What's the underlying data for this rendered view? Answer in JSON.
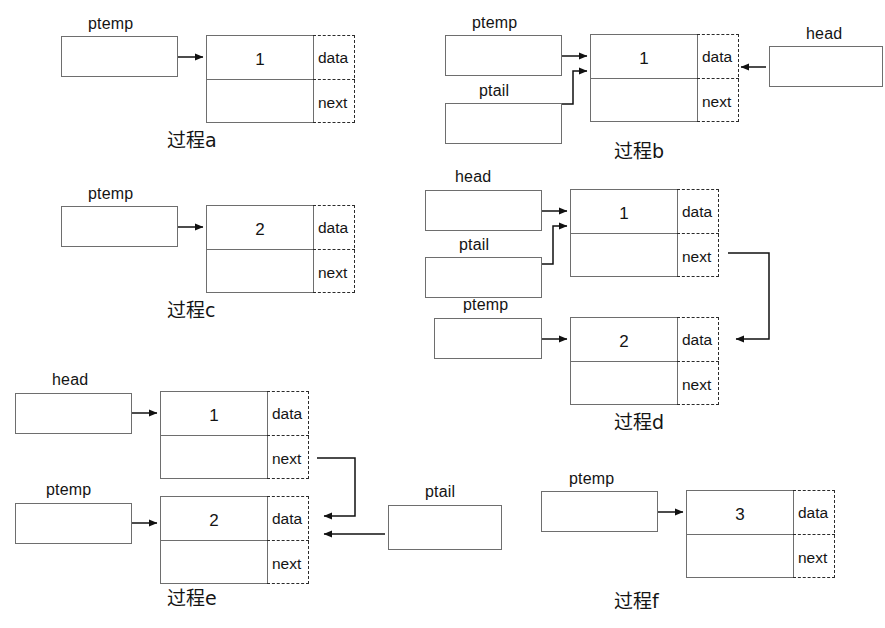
{
  "diagram": {
    "stroke_color": "#6e6e6e",
    "dash_color": "#2b2b2b",
    "background": "#ffffff",
    "field_labels": {
      "data": "data",
      "next": "next"
    },
    "pointer_names": {
      "ptemp": "ptemp",
      "ptail": "ptail",
      "head": "head"
    },
    "steps": [
      {
        "id": "a",
        "caption": "过程a",
        "pointers": [
          {
            "name": "ptemp"
          }
        ],
        "nodes": [
          {
            "value": "1",
            "data_label": "data",
            "next_label": "next"
          }
        ]
      },
      {
        "id": "b",
        "caption": "过程b",
        "pointers": [
          {
            "name": "ptemp"
          },
          {
            "name": "ptail"
          },
          {
            "name": "head"
          }
        ],
        "nodes": [
          {
            "value": "1",
            "data_label": "data",
            "next_label": "next"
          }
        ]
      },
      {
        "id": "c",
        "caption": "过程c",
        "pointers": [
          {
            "name": "ptemp"
          }
        ],
        "nodes": [
          {
            "value": "2",
            "data_label": "data",
            "next_label": "next"
          }
        ]
      },
      {
        "id": "d",
        "caption": "过程d",
        "pointers": [
          {
            "name": "head"
          },
          {
            "name": "ptail"
          },
          {
            "name": "ptemp"
          }
        ],
        "nodes": [
          {
            "value": "1",
            "data_label": "data",
            "next_label": "next"
          },
          {
            "value": "2",
            "data_label": "data",
            "next_label": "next"
          }
        ]
      },
      {
        "id": "e",
        "caption": "过程e",
        "pointers": [
          {
            "name": "head"
          },
          {
            "name": "ptemp"
          },
          {
            "name": "ptail"
          }
        ],
        "nodes": [
          {
            "value": "1",
            "data_label": "data",
            "next_label": "next"
          },
          {
            "value": "2",
            "data_label": "data",
            "next_label": "next"
          }
        ]
      },
      {
        "id": "f",
        "caption": "过程f",
        "pointers": [
          {
            "name": "ptemp"
          }
        ],
        "nodes": [
          {
            "value": "3",
            "data_label": "data",
            "next_label": "next"
          }
        ]
      }
    ]
  }
}
